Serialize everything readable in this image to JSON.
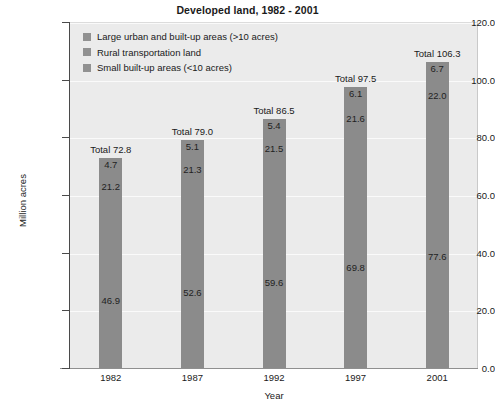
{
  "chart_data": {
    "type": "bar",
    "subtype": "stacked-bar",
    "title": "Developed land, 1982 - 2001",
    "xlabel": "Year",
    "ylabel": "Million acres",
    "categories": [
      "1982",
      "1987",
      "1992",
      "1997",
      "2001"
    ],
    "ylim": [
      0.0,
      120.0
    ],
    "ytick_labels": [
      "0.0",
      "20.0",
      "40.0",
      "60.0",
      "80.0",
      "100.0",
      "120.0"
    ],
    "ytick_values": [
      0.0,
      20.0,
      40.0,
      60.0,
      80.0,
      100.0,
      120.0
    ],
    "grid": true,
    "legend_position": "top-left-inside",
    "stack_order_bottom_to_top": [
      "Small built-up areas (<10 acres)",
      "Rural transportation land",
      "Large urban and built-up areas (>10 acres)"
    ],
    "series": [
      {
        "name": "Small built-up areas (<10 acres)",
        "color": "#8b8b8b",
        "values": [
          46.9,
          52.6,
          59.6,
          69.8,
          77.6
        ],
        "labels": [
          "46.9",
          "52.6",
          "59.6",
          "69.8",
          "77.6"
        ]
      },
      {
        "name": "Rural transportation land",
        "color": "#8b8b8b",
        "values": [
          21.2,
          21.3,
          21.5,
          21.6,
          22.0
        ],
        "labels": [
          "21.2",
          "21.3",
          "21.5",
          "21.6",
          "22.0"
        ]
      },
      {
        "name": "Large urban and built-up areas (>10 acres)",
        "color": "#8b8b8b",
        "values": [
          4.7,
          5.1,
          5.4,
          6.1,
          6.7
        ],
        "labels": [
          "4.7",
          "5.1",
          "5.4",
          "6.1",
          "6.7"
        ]
      }
    ],
    "totals": [
      72.8,
      79.0,
      86.5,
      97.5,
      106.3
    ],
    "total_labels": [
      "Total 72.8",
      "Total 79.0",
      "Total 86.5",
      "Total 97.5",
      "Total 106.3"
    ],
    "annotations": {
      "note": "Each bar is annotated with its stacked segment values and a total above the bar."
    }
  },
  "legend": {
    "items": [
      {
        "label": "Large urban and built-up areas (>10 acres)",
        "color": "#919191"
      },
      {
        "label": "Rural transportation land",
        "color": "#919191"
      },
      {
        "label": "Small built-up areas (<10 acres)",
        "color": "#919191"
      }
    ]
  },
  "colors": {
    "plot_background": "#ebebeb",
    "gridline": "#fafafa",
    "bar_fill": "#8b8b8b",
    "axis": "#4a4a4a",
    "text": "#1a1a1a"
  }
}
